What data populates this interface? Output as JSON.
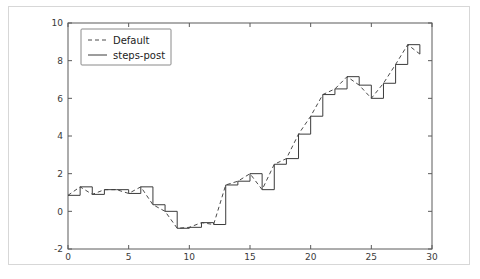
{
  "figure": {
    "background_color": "#ffffff",
    "frame_color": "#d7d7d7"
  },
  "chart_data": {
    "type": "line",
    "title": "",
    "xlabel": "",
    "ylabel": "",
    "xlim": [
      0,
      30
    ],
    "ylim": [
      -2,
      10
    ],
    "xticks": [
      0,
      5,
      10,
      15,
      20,
      25,
      30
    ],
    "xtick_labels": [
      "0",
      "5",
      "10",
      "15",
      "20",
      "25",
      "30"
    ],
    "yticks": [
      -2,
      0,
      2,
      4,
      6,
      8,
      10
    ],
    "ytick_labels": [
      "-2",
      "0",
      "2",
      "4",
      "6",
      "8",
      "10"
    ],
    "grid": false,
    "legend_position": "upper left",
    "x": [
      0,
      1,
      2,
      3,
      4,
      5,
      6,
      7,
      8,
      9,
      10,
      11,
      12,
      13,
      14,
      15,
      16,
      17,
      18,
      19,
      20,
      21,
      22,
      23,
      24,
      25,
      26,
      27,
      28,
      29
    ],
    "series": [
      {
        "name": "Default",
        "style": "dashed",
        "color": "#4a4a4a",
        "drawstyle": "default",
        "values": [
          0.85,
          1.3,
          0.9,
          1.15,
          1.15,
          0.95,
          1.3,
          0.35,
          0.0,
          -0.9,
          -0.85,
          -0.6,
          -0.7,
          1.4,
          1.6,
          2.0,
          1.15,
          2.5,
          2.8,
          4.1,
          5.05,
          6.2,
          6.5,
          7.15,
          6.7,
          6.0,
          6.8,
          7.8,
          8.85,
          8.35
        ]
      },
      {
        "name": "steps-post",
        "style": "solid",
        "color": "#3b3b3b",
        "drawstyle": "steps-post",
        "values": [
          0.85,
          1.3,
          0.9,
          1.15,
          1.15,
          0.95,
          1.3,
          0.35,
          0.0,
          -0.9,
          -0.85,
          -0.6,
          -0.7,
          1.4,
          1.6,
          2.0,
          1.15,
          2.5,
          2.8,
          4.1,
          5.05,
          6.2,
          6.5,
          7.15,
          6.7,
          6.0,
          6.8,
          7.8,
          8.85,
          8.35
        ]
      }
    ],
    "final_point": 7.5
  },
  "legend": {
    "entries": [
      {
        "label": "Default",
        "marker": "dashed-line"
      },
      {
        "label": "steps-post",
        "marker": "solid-line"
      }
    ]
  }
}
